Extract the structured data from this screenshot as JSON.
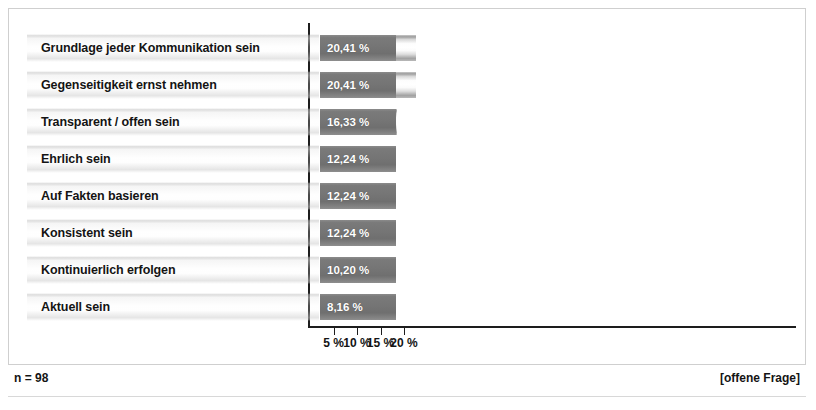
{
  "chart_data": {
    "type": "bar",
    "orientation": "horizontal",
    "title": "",
    "xlabel": "",
    "ylabel": "",
    "xlim": [
      0,
      21.7
    ],
    "grid": false,
    "legend": false,
    "categories": [
      "Grundlage jeder Kommunikation sein",
      "Gegenseitigkeit ernst nehmen",
      "Transparent / offen sein",
      "Ehrlich sein",
      "Auf Fakten basieren",
      "Konsistent sein",
      "Kontinuierlich erfolgen",
      "Aktuell sein"
    ],
    "values": [
      20.41,
      20.41,
      16.33,
      12.24,
      12.24,
      12.24,
      10.2,
      8.16
    ],
    "value_labels": [
      "20,41 %",
      "20,41 %",
      "16,33 %",
      "12,24 %",
      "12,24 %",
      "12,24 %",
      "10,20 %",
      "8,16 %"
    ],
    "ticks": [
      5,
      10,
      15,
      20
    ],
    "tick_labels": [
      "5 %",
      "10 %",
      "15 %",
      "20 %"
    ],
    "unit": "%"
  },
  "footer": {
    "sample_size": "n = 98",
    "question_type": "[offene Frage]"
  },
  "colors": {
    "value_box": "#757575",
    "bar_light": "#ffffff",
    "axis": "#1d1d1d",
    "text": "#141414",
    "frame": "#cfcfcf"
  }
}
